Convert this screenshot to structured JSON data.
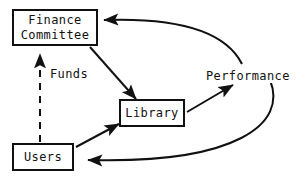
{
  "diagram": {
    "background_color": "#ffffff",
    "stroke_color": "#111111",
    "nodes": [
      {
        "id": "finance-committee",
        "lines": [
          "Finance",
          "Committee"
        ],
        "shape": "rectangle"
      },
      {
        "id": "library",
        "lines": [
          "Library"
        ],
        "shape": "rectangle"
      },
      {
        "id": "users",
        "lines": [
          "Users"
        ],
        "shape": "rectangle"
      }
    ],
    "edge_labels": {
      "funds": "Funds",
      "performance": "Performance"
    },
    "edges": [
      {
        "id": "funds-edge",
        "from": "finance-committee",
        "to": "library",
        "label": "Funds",
        "style": "solid",
        "arrowhead": "to"
      },
      {
        "id": "library-performance-edge",
        "from": "library",
        "to": "performance",
        "label": "Performance",
        "style": "solid",
        "arrowhead": "to"
      },
      {
        "id": "performance-finance-edge",
        "from": "performance",
        "to": "finance-committee",
        "label": "",
        "style": "solid-curved",
        "arrowhead": "to"
      },
      {
        "id": "performance-users-edge",
        "from": "performance",
        "to": "users",
        "label": "",
        "style": "solid-curved",
        "arrowhead": "to"
      },
      {
        "id": "users-library-edge",
        "from": "users",
        "to": "library",
        "label": "",
        "style": "solid",
        "arrowhead": "to"
      },
      {
        "id": "users-finance-edge",
        "from": "users",
        "to": "finance-committee",
        "label": "",
        "style": "dashed",
        "arrowhead": "to"
      }
    ]
  }
}
